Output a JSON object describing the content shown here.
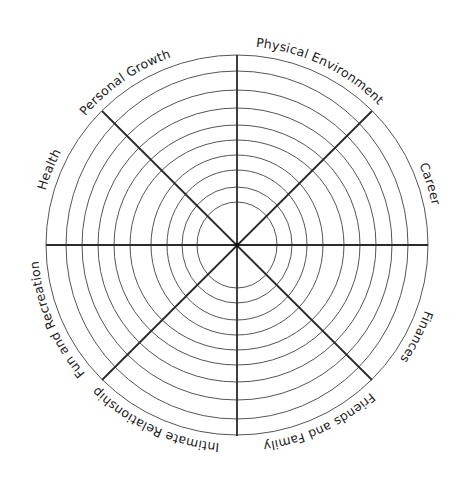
{
  "diagram": {
    "center": [
      237,
      245
    ],
    "rings": [
      {
        "rx": 191,
        "ry": 190
      },
      {
        "rx": 171,
        "ry": 174
      },
      {
        "rx": 155,
        "ry": 155
      },
      {
        "rx": 139,
        "ry": 137
      },
      {
        "rx": 123,
        "ry": 120
      },
      {
        "rx": 107,
        "ry": 105
      },
      {
        "rx": 86,
        "ry": 90
      },
      {
        "rx": 70,
        "ry": 75
      },
      {
        "rx": 55,
        "ry": 58
      },
      {
        "rx": 40,
        "ry": 43
      }
    ],
    "spoke_count": 8,
    "colors": {
      "ring": "#555555",
      "spoke": "#2a2a2a",
      "text": "#222222",
      "background": "#ffffff"
    }
  },
  "labels": {
    "physical_environment": "Physical Environment",
    "career": "Career",
    "finances": "Finances",
    "friends_and_family": "Friends and Family",
    "intimate_relationship": "Intimate Relationship",
    "fun_and_recreation": "Fun and Recreation",
    "health": "Health",
    "personal_growth": "Personal Growth"
  }
}
